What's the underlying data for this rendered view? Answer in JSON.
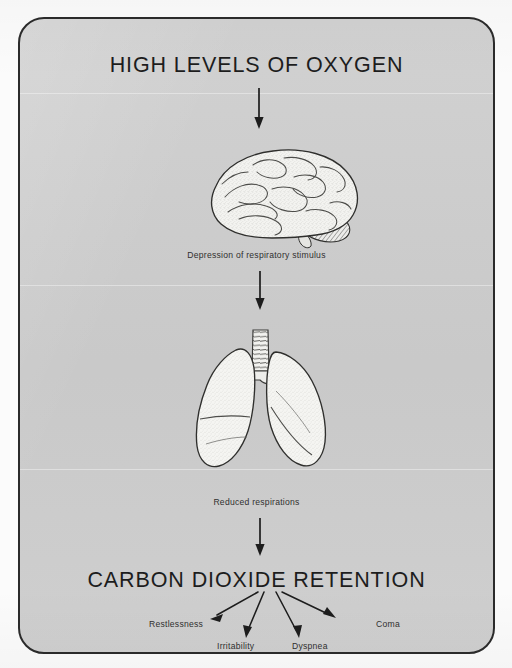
{
  "document": {
    "type": "medical-flow-diagram",
    "subject": "Oxygen-induced carbon dioxide retention",
    "panel_background": "#cccccc",
    "border_color": "#2b2b2b",
    "text_color": "#30302f"
  },
  "flow": {
    "title": "HIGH LEVELS OF OXYGEN",
    "outcome": "CARBON DIOXIDE RETENTION",
    "steps": [
      {
        "illustration": "brain-illustration",
        "caption": "Depression of respiratory stimulus"
      },
      {
        "illustration": "lungs-illustration",
        "caption": "Reduced respirations"
      }
    ],
    "arrows": [
      {
        "name": "arrow-title-to-brain",
        "direction": "down"
      },
      {
        "name": "arrow-brain-to-lungs",
        "direction": "down"
      },
      {
        "name": "arrow-lungs-to-retention",
        "direction": "down"
      }
    ],
    "symptoms": [
      {
        "label": "Restlessness",
        "arrow": "down-left"
      },
      {
        "label": "Irritability",
        "arrow": "down-left-short"
      },
      {
        "label": "Dyspnea",
        "arrow": "down-right-short"
      },
      {
        "label": "Coma",
        "arrow": "down-right"
      }
    ]
  }
}
